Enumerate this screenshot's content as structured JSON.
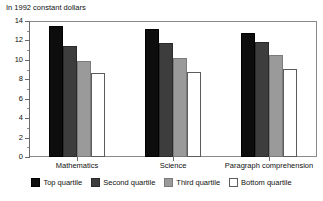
{
  "chart_data": {
    "type": "bar",
    "title": "In 1992 constant dollars",
    "subtitle": "",
    "xlabel": "",
    "ylabel": "",
    "ylim": [
      0,
      14
    ],
    "ytick_step": 2,
    "ytick_labels": [
      "0",
      "2",
      "4",
      "6",
      "8",
      "10",
      "12",
      "14"
    ],
    "grid": false,
    "legend_position": "bottom",
    "categories": [
      "Mathematics",
      "Science",
      "Paragraph comprehension"
    ],
    "series": [
      {
        "name": "Top quartile",
        "color": "#0d0d0d",
        "values": [
          13.5,
          13.2,
          12.8
        ]
      },
      {
        "name": "Second quartile",
        "color": "#3d3d3d",
        "values": [
          11.4,
          11.7,
          11.8
        ]
      },
      {
        "name": "Third quartile",
        "color": "#9a9a9a",
        "values": [
          9.9,
          10.2,
          10.5
        ]
      },
      {
        "name": "Bottom quartile",
        "color": "#ffffff",
        "values": [
          8.6,
          8.8,
          9.1
        ]
      }
    ]
  }
}
